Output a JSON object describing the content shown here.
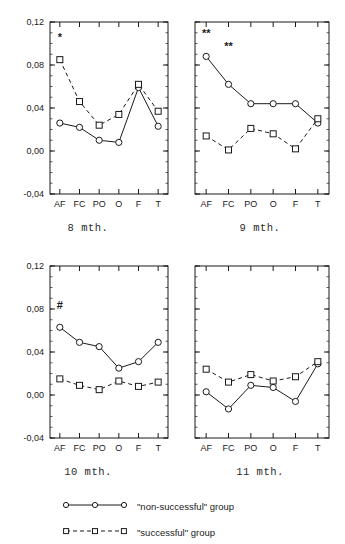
{
  "figure": {
    "y_ticks": [
      "0,12",
      "0,08",
      "0,04",
      "0,00",
      "-0,04"
    ],
    "x_ticks": [
      "AF",
      "FC",
      "PO",
      "O",
      "F",
      "T"
    ]
  },
  "panels": [
    {
      "id": "panel-8-mth",
      "caption": "8 mth.",
      "annotations": [
        {
          "text": "*",
          "x_category": "AF",
          "y_value": 0.102
        }
      ]
    },
    {
      "id": "panel-9-mth",
      "caption": "9 mth.",
      "annotations": [
        {
          "text": "**",
          "x_category": "AF",
          "y_value": 0.106
        },
        {
          "text": "**",
          "x_category": "FC",
          "y_value": 0.094
        }
      ]
    },
    {
      "id": "panel-10-mth",
      "caption": "10 mth.",
      "annotations": [
        {
          "text": "#",
          "x_category": "AF",
          "y_value": 0.08
        }
      ]
    },
    {
      "id": "panel-11-mth",
      "caption": "11 mth.",
      "annotations": []
    }
  ],
  "legend": {
    "entries": [
      {
        "label": "\"non-successful\" group",
        "marker": "circle",
        "line": "solid"
      },
      {
        "label": "\"successful\" group",
        "marker": "square",
        "line": "dashed"
      }
    ]
  },
  "chart_data": [
    {
      "type": "line",
      "title": "8 mth.",
      "xlabel": "",
      "ylabel": "",
      "categories": [
        "AF",
        "FC",
        "PO",
        "O",
        "F",
        "T"
      ],
      "ylim": [
        -0.04,
        0.12
      ],
      "yticks": [
        -0.04,
        0.0,
        0.04,
        0.08,
        0.12
      ],
      "grid": false,
      "legend": "below",
      "series": [
        {
          "name": "\"non-successful\" group",
          "marker": "circle",
          "line": "solid",
          "values": [
            0.026,
            0.022,
            0.01,
            0.008,
            0.059,
            0.023
          ]
        },
        {
          "name": "\"successful\" group",
          "marker": "square",
          "line": "dashed",
          "values": [
            0.085,
            0.046,
            0.024,
            0.034,
            0.062,
            0.037
          ]
        }
      ],
      "annotations": [
        {
          "text": "*",
          "x": "AF",
          "y": 0.102
        }
      ]
    },
    {
      "type": "line",
      "title": "9 mth.",
      "xlabel": "",
      "ylabel": "",
      "categories": [
        "AF",
        "FC",
        "PO",
        "O",
        "F",
        "T"
      ],
      "ylim": [
        -0.04,
        0.12
      ],
      "yticks": [
        -0.04,
        0.0,
        0.04,
        0.08,
        0.12
      ],
      "grid": false,
      "legend": "below",
      "series": [
        {
          "name": "\"non-successful\" group",
          "marker": "circle",
          "line": "solid",
          "values": [
            0.088,
            0.062,
            0.044,
            0.044,
            0.044,
            0.026
          ]
        },
        {
          "name": "\"successful\" group",
          "marker": "square",
          "line": "dashed",
          "values": [
            0.014,
            0.001,
            0.021,
            0.016,
            0.002,
            0.03
          ]
        }
      ],
      "annotations": [
        {
          "text": "**",
          "x": "AF",
          "y": 0.106
        },
        {
          "text": "**",
          "x": "FC",
          "y": 0.094
        }
      ]
    },
    {
      "type": "line",
      "title": "10 mth.",
      "xlabel": "",
      "ylabel": "",
      "categories": [
        "AF",
        "FC",
        "PO",
        "O",
        "F",
        "T"
      ],
      "ylim": [
        -0.04,
        0.12
      ],
      "yticks": [
        -0.04,
        0.0,
        0.04,
        0.08,
        0.12
      ],
      "grid": false,
      "legend": "below",
      "series": [
        {
          "name": "\"non-successful\" group",
          "marker": "circle",
          "line": "solid",
          "values": [
            0.063,
            0.049,
            0.045,
            0.025,
            0.031,
            0.049
          ]
        },
        {
          "name": "\"successful\" group",
          "marker": "square",
          "line": "dashed",
          "values": [
            0.015,
            0.009,
            0.005,
            0.013,
            0.008,
            0.012
          ]
        }
      ],
      "annotations": [
        {
          "text": "#",
          "x": "AF",
          "y": 0.08
        }
      ]
    },
    {
      "type": "line",
      "title": "11 mth.",
      "xlabel": "",
      "ylabel": "",
      "categories": [
        "AF",
        "FC",
        "PO",
        "O",
        "F",
        "T"
      ],
      "ylim": [
        -0.04,
        0.12
      ],
      "yticks": [
        -0.04,
        0.0,
        0.04,
        0.08,
        0.12
      ],
      "grid": false,
      "legend": "below",
      "series": [
        {
          "name": "\"non-successful\" group",
          "marker": "circle",
          "line": "solid",
          "values": [
            0.003,
            -0.013,
            0.009,
            0.007,
            -0.006,
            0.029
          ]
        },
        {
          "name": "\"successful\" group",
          "marker": "square",
          "line": "dashed",
          "values": [
            0.024,
            0.012,
            0.019,
            0.013,
            0.017,
            0.031
          ]
        }
      ],
      "annotations": []
    }
  ]
}
